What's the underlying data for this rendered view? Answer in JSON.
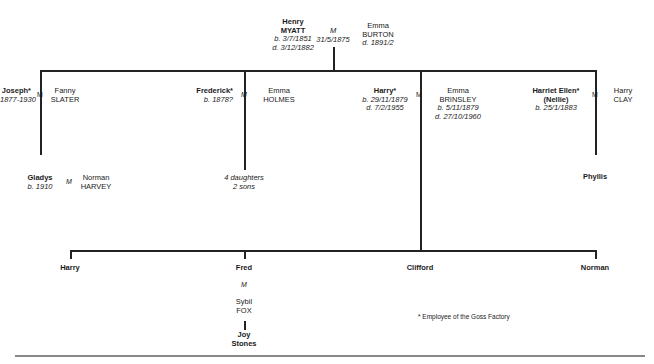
{
  "root": {
    "husband": {
      "first": "Henry",
      "surname": "MYATT",
      "born": "b. 3/7/1851",
      "died": "d. 3/12/1882"
    },
    "marriage": {
      "symbol": "M",
      "date": "31/5/1875"
    },
    "wife": {
      "first": "Emma",
      "surname": "BURTON",
      "died": "d. 1891/2"
    }
  },
  "generation2": [
    {
      "name": "Joseph*",
      "dates": "1877-1930",
      "marriage": "M",
      "spouse_first": "Fanny",
      "spouse_surname": "SLATER"
    },
    {
      "name": "Frederick*",
      "dates": "b. 1878?",
      "marriage": "M",
      "spouse_first": "Emma",
      "spouse_surname": "HOLMES"
    },
    {
      "name": "Harry*",
      "born": "b. 29/11/1879",
      "died": "d. 7/2/1955",
      "marriage": "M",
      "spouse_first": "Emma",
      "spouse_surname": "BRINSLEY",
      "spouse_born": "b. 5/11/1879",
      "spouse_died": "d. 27/10/1960"
    },
    {
      "name": "Harriet Ellen*",
      "nickname": "(Nellie)",
      "born": "b. 25/1/1883",
      "marriage": "M",
      "spouse_first": "Harry",
      "spouse_surname": "CLAY"
    }
  ],
  "generation3": {
    "joseph_child": {
      "name": "Gladys",
      "born": "b. 1910",
      "marriage": "M",
      "spouse_first": "Norman",
      "spouse_surname": "HARVEY"
    },
    "frederick_children": {
      "line1": "4 daughters",
      "line2": "2 sons"
    },
    "harriet_child": {
      "name": "Phyllis"
    },
    "harry_children": [
      {
        "name": "Harry"
      },
      {
        "name": "Fred",
        "marriage": "M",
        "spouse_first": "Sybil",
        "spouse_surname": "FOX"
      },
      {
        "name": "Clifford"
      },
      {
        "name": "Norman"
      }
    ]
  },
  "generation4": {
    "fred_child_first": "Joy",
    "fred_child_surname": "Stones"
  },
  "footnote": "* Employee of the Goss Factory"
}
